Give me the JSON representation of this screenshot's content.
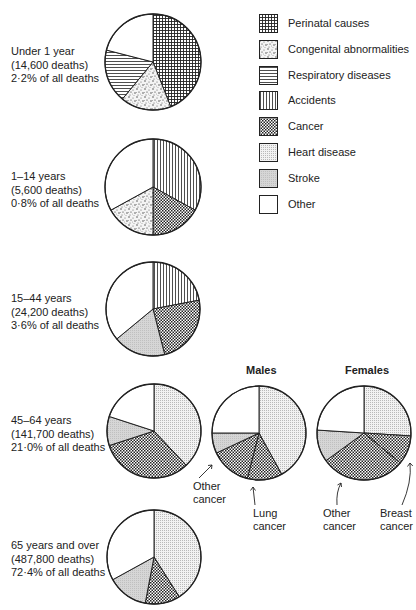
{
  "legend": [
    {
      "key": "perinatal",
      "label": "Perinatal causes",
      "pattern": "grid"
    },
    {
      "key": "congenital",
      "label": "Congenital abnormalities",
      "pattern": "speckle"
    },
    {
      "key": "respiratory",
      "label": "Respiratory diseases",
      "pattern": "hlines"
    },
    {
      "key": "accidents",
      "label": "Accidents",
      "pattern": "vlines"
    },
    {
      "key": "cancer",
      "label": "Cancer",
      "pattern": "checker"
    },
    {
      "key": "heart",
      "label": "Heart disease",
      "pattern": "light-dots"
    },
    {
      "key": "stroke",
      "label": "Stroke",
      "pattern": "gray"
    },
    {
      "key": "other",
      "label": "Other",
      "pattern": "white"
    }
  ],
  "groups": [
    {
      "line1": "Under 1 year",
      "line2": "(14,600 deaths)",
      "line3": "2·2% of all deaths"
    },
    {
      "line1": "1–14 years",
      "line2": "(5,600 deaths)",
      "line3": "0·8% of all deaths"
    },
    {
      "line1": "15–44 years",
      "line2": "(24,200 deaths)",
      "line3": "3·6% of all deaths"
    },
    {
      "line1": "45–64 years",
      "line2": "(141,700 deaths)",
      "line3": "21·0% of all deaths"
    },
    {
      "line1": "65 years and over",
      "line2": "(487,800 deaths)",
      "line3": "72·4% of all deaths"
    }
  ],
  "subcharts": {
    "males_title": "Males",
    "females_title": "Females",
    "males_other_cancer_1": "Other",
    "males_other_cancer_2": "cancer",
    "males_lung_cancer_1": "Lung",
    "males_lung_cancer_2": "cancer",
    "females_other_cancer_1": "Other",
    "females_other_cancer_2": "cancer",
    "females_breast_cancer_1": "Breast",
    "females_breast_cancer_2": "cancer"
  },
  "chart_data": [
    {
      "type": "pie",
      "title": "Under 1 year (14,600 deaths) 2·2% of all deaths",
      "categories": [
        "Perinatal causes",
        "Congenital abnormalities",
        "Respiratory diseases",
        "Other"
      ],
      "values": [
        44,
        17,
        18,
        21
      ]
    },
    {
      "type": "pie",
      "title": "1–14 years (5,600 deaths) 0·8% of all deaths",
      "categories": [
        "Accidents",
        "Cancer",
        "Congenital abnormalities",
        "Other"
      ],
      "values": [
        33,
        17,
        17,
        33
      ]
    },
    {
      "type": "pie",
      "title": "15–44 years (24,200 deaths) 3·6% of all deaths",
      "categories": [
        "Accidents",
        "Cancer",
        "Stroke",
        "Other"
      ],
      "values": [
        22,
        24,
        18,
        36
      ]
    },
    {
      "type": "pie",
      "title": "45–64 years (141,700 deaths) 21·0% of all deaths",
      "categories": [
        "Heart disease",
        "Cancer",
        "Stroke",
        "Other"
      ],
      "values": [
        38,
        32,
        10,
        20
      ]
    },
    {
      "type": "pie",
      "title": "45–64 years Males",
      "categories": [
        "Heart disease",
        "Lung cancer",
        "Other cancer",
        "Stroke",
        "Other"
      ],
      "values": [
        42,
        12,
        14,
        7,
        25
      ]
    },
    {
      "type": "pie",
      "title": "45–64 years Females",
      "categories": [
        "Heart disease",
        "Breast cancer",
        "Other cancer",
        "Stroke",
        "Other"
      ],
      "values": [
        26,
        10,
        29,
        11,
        24
      ]
    },
    {
      "type": "pie",
      "title": "65 years and over (487,800 deaths) 72·4% of all deaths",
      "categories": [
        "Heart disease",
        "Cancer",
        "Stroke",
        "Other"
      ],
      "values": [
        41,
        12,
        14,
        33
      ]
    }
  ]
}
